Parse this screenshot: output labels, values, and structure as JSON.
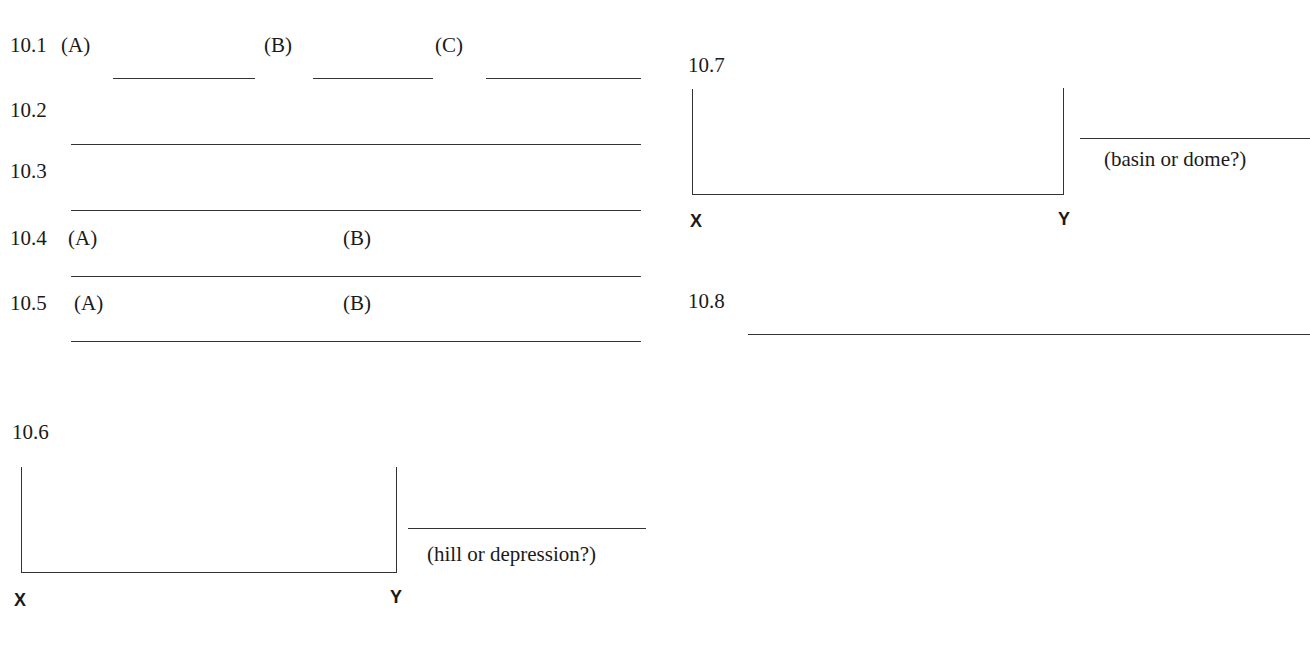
{
  "worksheet": {
    "q10_1": {
      "number": "10.1",
      "parts": [
        "(A)",
        "(B)",
        "(C)"
      ]
    },
    "q10_2": {
      "number": "10.2"
    },
    "q10_3": {
      "number": "10.3"
    },
    "q10_4": {
      "number": "10.4",
      "parts": [
        "(A)",
        "(B)"
      ]
    },
    "q10_5": {
      "number": "10.5",
      "parts": [
        "(A)",
        "(B)"
      ]
    },
    "q10_6": {
      "number": "10.6",
      "x_label": "X",
      "y_label": "Y",
      "answer_hint": "(hill or depression?)"
    },
    "q10_7": {
      "number": "10.7",
      "x_label": "X",
      "y_label": "Y",
      "answer_hint": "(basin or dome?)"
    },
    "q10_8": {
      "number": "10.8"
    }
  }
}
